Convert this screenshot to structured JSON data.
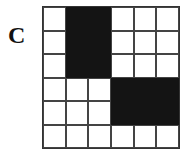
{
  "label": "C",
  "grid": {
    "rows": 6,
    "cols": 6,
    "filled": [
      [
        0,
        1,
        1,
        0,
        0,
        0
      ],
      [
        0,
        1,
        1,
        0,
        0,
        0
      ],
      [
        0,
        1,
        1,
        0,
        0,
        0
      ],
      [
        0,
        0,
        0,
        1,
        1,
        1
      ],
      [
        0,
        0,
        0,
        1,
        1,
        1
      ],
      [
        0,
        0,
        0,
        0,
        0,
        0
      ]
    ]
  },
  "colors": {
    "filled": "#141414",
    "empty": "#ffffff",
    "line": "#444444"
  }
}
